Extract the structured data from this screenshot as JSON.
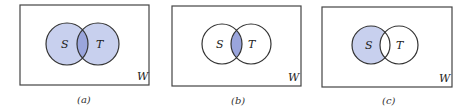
{
  "figure": {
    "panels": [
      {
        "caption": "(a)",
        "universe_label": "W",
        "set_labels": [
          "S",
          "T"
        ],
        "shaded": "union",
        "box": {
          "x": 20,
          "y": 5,
          "w": 129,
          "h": 80
        },
        "circles": [
          {
            "cx": 67,
            "cy": 44,
            "r": 21
          },
          {
            "cx": 98,
            "cy": 44,
            "r": 21
          }
        ]
      },
      {
        "caption": "(b)",
        "universe_label": "W",
        "set_labels": [
          "S",
          "T"
        ],
        "shaded": "intersection",
        "box": {
          "x": 172,
          "y": 6,
          "w": 129,
          "h": 80
        },
        "circles": [
          {
            "cx": 222,
            "cy": 44,
            "r": 20
          },
          {
            "cx": 251,
            "cy": 44,
            "r": 20
          }
        ]
      },
      {
        "caption": "(c)",
        "universe_label": "W",
        "set_labels": [
          "S",
          "T"
        ],
        "shaded": "S minus T",
        "box": {
          "x": 322,
          "y": 7,
          "w": 130,
          "h": 80
        },
        "circles": [
          {
            "cx": 371,
            "cy": 45,
            "r": 19
          },
          {
            "cx": 399,
            "cy": 45,
            "r": 19
          }
        ]
      }
    ],
    "colors": {
      "shade_light": "#c8d0ee",
      "shade_dark": "#9aa5dc",
      "stroke": "#333333"
    }
  }
}
